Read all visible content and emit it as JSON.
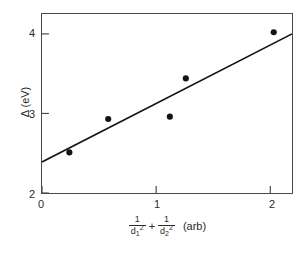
{
  "chart_data": {
    "type": "scatter",
    "title": "",
    "xlabel": "1/d₁² + 1/d₂² (arb)",
    "ylabel": "Δ (eV)",
    "xlabel_parts": {
      "frac1_num": "1",
      "frac1_den_base": "d",
      "frac1_den_sub": "1",
      "frac1_den_sup": "2",
      "operator": "+",
      "frac2_num": "1",
      "frac2_den_base": "d",
      "frac2_den_sub": "2",
      "frac2_den_sup": "2",
      "units": "(arb)"
    },
    "xlim": [
      0,
      2.19
    ],
    "ylim": [
      2,
      4.25
    ],
    "xticks": [
      0,
      1,
      2
    ],
    "xtick_labels": [
      "0",
      "1",
      "2"
    ],
    "yticks": [
      2,
      3,
      4
    ],
    "ytick_labels": [
      "2",
      "3",
      "4"
    ],
    "grid": false,
    "legend": null,
    "marker": "filled-circle",
    "marker_color": "#141414",
    "line_color": "#141414",
    "points": [
      {
        "x": 0.24,
        "y": 2.51
      },
      {
        "x": 0.58,
        "y": 2.93
      },
      {
        "x": 1.12,
        "y": 2.96
      },
      {
        "x": 1.26,
        "y": 3.44
      },
      {
        "x": 2.03,
        "y": 4.02
      }
    ],
    "fit_line": {
      "x_start": 0.0,
      "y_start": 2.39,
      "x_end": 2.19,
      "y_end": 4.0,
      "slope": 0.735,
      "intercept": 2.39
    }
  }
}
